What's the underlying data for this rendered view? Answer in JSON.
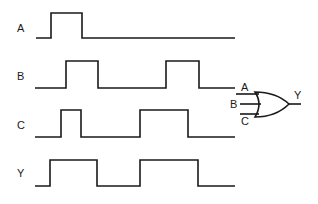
{
  "diagram": {
    "type": "timing-diagram-with-or-gate",
    "signals": [
      {
        "name": "A",
        "label_y": 32,
        "low_y": 38,
        "high_y": 13,
        "points": [
          [
            36,
            0
          ],
          [
            51,
            1
          ],
          [
            82,
            0
          ],
          [
            235,
            0
          ]
        ]
      },
      {
        "name": "B",
        "label_y": 80,
        "low_y": 88,
        "high_y": 61,
        "points": [
          [
            35,
            0
          ],
          [
            66,
            1
          ],
          [
            98,
            0
          ],
          [
            166,
            1
          ],
          [
            199,
            0
          ],
          [
            235,
            0
          ]
        ]
      },
      {
        "name": "C",
        "label_y": 129,
        "low_y": 137,
        "high_y": 110,
        "points": [
          [
            35,
            0
          ],
          [
            61,
            1
          ],
          [
            81,
            0
          ],
          [
            140,
            1
          ],
          [
            188,
            0
          ],
          [
            235,
            0
          ]
        ]
      },
      {
        "name": "Y",
        "label_y": 177,
        "low_y": 186,
        "high_y": 160,
        "points": [
          [
            35,
            0
          ],
          [
            50,
            1
          ],
          [
            97,
            0
          ],
          [
            140,
            1
          ],
          [
            198,
            0
          ],
          [
            235,
            0
          ]
        ]
      }
    ],
    "gate": {
      "kind": "OR",
      "inputs": [
        "A",
        "B",
        "C"
      ],
      "output": "Y"
    }
  }
}
